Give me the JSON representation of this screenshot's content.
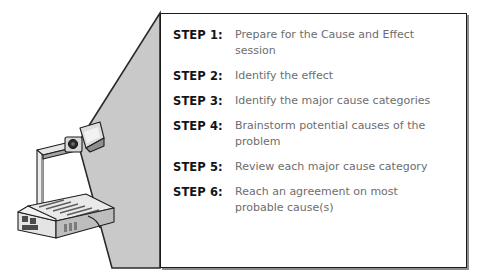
{
  "figure": {
    "background_color": "#ffffff",
    "beam_color": "#c9c9c9",
    "beam_edge_color": "#2a2a2a",
    "box_border_color": "#1b1b1b",
    "box_shadow_color": "#8d8d8d",
    "label_color": "#141414",
    "description_color": "#6d6d6d"
  },
  "projector": {
    "name": "overhead-projector",
    "body_color": "#e8e8e8",
    "shade_color": "#9a9a9a",
    "outline_color": "#1e1e1e",
    "lens_color": "#2b2b2b"
  },
  "steps_box": {
    "steps": [
      {
        "label": "STEP 1:",
        "description": "Prepare for the Cause and Effect session"
      },
      {
        "label": "STEP 2:",
        "description": "Identify the effect"
      },
      {
        "label": "STEP 3:",
        "description": "Identify the major cause categories"
      },
      {
        "label": "STEP 4:",
        "description": "Brainstorm potential causes of the problem"
      },
      {
        "label": "STEP 5:",
        "description": "Review each major cause category"
      },
      {
        "label": "STEP 6:",
        "description": "Reach an agreement on most probable cause(s)"
      }
    ]
  }
}
